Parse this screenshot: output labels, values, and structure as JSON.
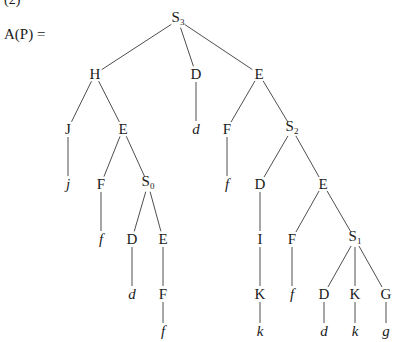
{
  "figure": {
    "part_label": "(2)",
    "equation_label": "A(P)  ="
  },
  "tree": {
    "nodes": [
      {
        "id": "n0",
        "label": "S",
        "sub": "3",
        "x": 178,
        "y": 20,
        "italic": false
      },
      {
        "id": "n1",
        "label": "H",
        "sub": "",
        "x": 95,
        "y": 74,
        "italic": false
      },
      {
        "id": "n2",
        "label": "D",
        "sub": "",
        "x": 196,
        "y": 74,
        "italic": false
      },
      {
        "id": "n3",
        "label": "E",
        "sub": "",
        "x": 259,
        "y": 74,
        "italic": false
      },
      {
        "id": "n4",
        "label": "J",
        "sub": "",
        "x": 68,
        "y": 129,
        "italic": false
      },
      {
        "id": "n5",
        "label": "E",
        "sub": "",
        "x": 123,
        "y": 129,
        "italic": false
      },
      {
        "id": "n6",
        "label": "d",
        "sub": "",
        "x": 196,
        "y": 129,
        "italic": true
      },
      {
        "id": "n7",
        "label": "F",
        "sub": "",
        "x": 227,
        "y": 129,
        "italic": false
      },
      {
        "id": "n8",
        "label": "S",
        "sub": "2",
        "x": 292,
        "y": 129,
        "italic": false
      },
      {
        "id": "n9",
        "label": "j",
        "sub": "",
        "x": 68,
        "y": 184,
        "italic": true
      },
      {
        "id": "n10",
        "label": "F",
        "sub": "",
        "x": 101,
        "y": 184,
        "italic": false
      },
      {
        "id": "n11",
        "label": "S",
        "sub": "0",
        "x": 148,
        "y": 184,
        "italic": false
      },
      {
        "id": "n12",
        "label": "f",
        "sub": "",
        "x": 227,
        "y": 184,
        "italic": true
      },
      {
        "id": "n13",
        "label": "D",
        "sub": "",
        "x": 260,
        "y": 184,
        "italic": false
      },
      {
        "id": "n14",
        "label": "E",
        "sub": "",
        "x": 323,
        "y": 184,
        "italic": false
      },
      {
        "id": "n15",
        "label": "f",
        "sub": "",
        "x": 101,
        "y": 239,
        "italic": true
      },
      {
        "id": "n16",
        "label": "D",
        "sub": "",
        "x": 132,
        "y": 239,
        "italic": false
      },
      {
        "id": "n17",
        "label": "E",
        "sub": "",
        "x": 163,
        "y": 239,
        "italic": false
      },
      {
        "id": "n18",
        "label": "I",
        "sub": "",
        "x": 260,
        "y": 239,
        "italic": false
      },
      {
        "id": "n19",
        "label": "F",
        "sub": "",
        "x": 292,
        "y": 239,
        "italic": false
      },
      {
        "id": "n20",
        "label": "S",
        "sub": "1",
        "x": 355,
        "y": 239,
        "italic": false
      },
      {
        "id": "n21",
        "label": "d",
        "sub": "",
        "x": 132,
        "y": 294,
        "italic": true
      },
      {
        "id": "n22",
        "label": "F",
        "sub": "",
        "x": 163,
        "y": 294,
        "italic": false
      },
      {
        "id": "n23",
        "label": "K",
        "sub": "",
        "x": 260,
        "y": 294,
        "italic": false
      },
      {
        "id": "n24",
        "label": "f",
        "sub": "",
        "x": 292,
        "y": 294,
        "italic": true
      },
      {
        "id": "n25",
        "label": "D",
        "sub": "",
        "x": 324,
        "y": 294,
        "italic": false
      },
      {
        "id": "n26",
        "label": "K",
        "sub": "",
        "x": 355,
        "y": 294,
        "italic": false
      },
      {
        "id": "n27",
        "label": "G",
        "sub": "",
        "x": 386,
        "y": 294,
        "italic": false
      },
      {
        "id": "n28",
        "label": "f",
        "sub": "",
        "x": 163,
        "y": 331,
        "italic": true
      },
      {
        "id": "n29",
        "label": "k",
        "sub": "",
        "x": 260,
        "y": 331,
        "italic": true
      },
      {
        "id": "n30",
        "label": "d",
        "sub": "",
        "x": 324,
        "y": 331,
        "italic": true
      },
      {
        "id": "n31",
        "label": "k",
        "sub": "",
        "x": 355,
        "y": 331,
        "italic": true
      },
      {
        "id": "n32",
        "label": "g",
        "sub": "",
        "x": 386,
        "y": 331,
        "italic": true
      }
    ],
    "edges": [
      [
        "n0",
        "n1"
      ],
      [
        "n0",
        "n2"
      ],
      [
        "n0",
        "n3"
      ],
      [
        "n1",
        "n4"
      ],
      [
        "n1",
        "n5"
      ],
      [
        "n2",
        "n6"
      ],
      [
        "n3",
        "n7"
      ],
      [
        "n3",
        "n8"
      ],
      [
        "n4",
        "n9"
      ],
      [
        "n5",
        "n10"
      ],
      [
        "n5",
        "n11"
      ],
      [
        "n7",
        "n12"
      ],
      [
        "n8",
        "n13"
      ],
      [
        "n8",
        "n14"
      ],
      [
        "n10",
        "n15"
      ],
      [
        "n11",
        "n16"
      ],
      [
        "n11",
        "n17"
      ],
      [
        "n13",
        "n18"
      ],
      [
        "n14",
        "n19"
      ],
      [
        "n14",
        "n20"
      ],
      [
        "n16",
        "n21"
      ],
      [
        "n17",
        "n22"
      ],
      [
        "n18",
        "n23"
      ],
      [
        "n19",
        "n24"
      ],
      [
        "n20",
        "n25"
      ],
      [
        "n20",
        "n26"
      ],
      [
        "n20",
        "n27"
      ],
      [
        "n22",
        "n28"
      ],
      [
        "n23",
        "n29"
      ],
      [
        "n25",
        "n30"
      ],
      [
        "n26",
        "n31"
      ],
      [
        "n27",
        "n32"
      ]
    ]
  }
}
